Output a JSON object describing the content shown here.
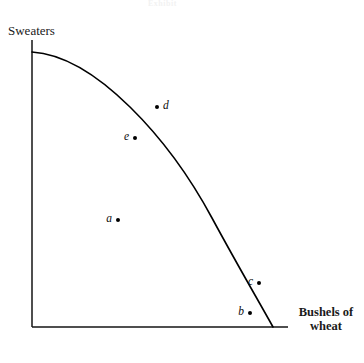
{
  "figure": {
    "type": "production-possibilities-frontier",
    "top_caption_artifact": "Exhibit",
    "background_color": "#ffffff",
    "ink_color": "#000000"
  },
  "axes": {
    "y_label": "Sweaters",
    "x_label_line1": "Bushels of",
    "x_label_line2": "wheat",
    "origin": {
      "x": 32,
      "y": 327
    },
    "y_axis_top": 40,
    "x_axis_right": 288
  },
  "chart_data": {
    "type": "line",
    "title": "",
    "subtitle": "",
    "xlabel": "Bushels of wheat",
    "ylabel": "Sweaters",
    "grid": false,
    "legend": "none",
    "axis_ticks": {
      "x": [],
      "y": []
    },
    "xlim": [
      0,
      1
    ],
    "ylim": [
      0,
      1
    ],
    "curves": [
      {
        "name": "production-possibilities-frontier",
        "description": "Concave-to-origin frontier from the sweaters axis intercept down to the wheat axis intercept",
        "path": "M 32 52 C 96 56, 170 140, 212 218 C 238 266, 258 300, 273 327",
        "stroke": "#000000",
        "stroke_width": 1.6,
        "points_px": [
          [
            32,
            52
          ],
          [
            70,
            63
          ],
          [
            105,
            82
          ],
          [
            130,
            103
          ],
          [
            160,
            131
          ],
          [
            190,
            175
          ],
          [
            220,
            230
          ],
          [
            250,
            276
          ],
          [
            262,
            298
          ],
          [
            273,
            327
          ]
        ]
      }
    ],
    "annotations": [
      {
        "label": "d",
        "x": 157,
        "y": 107,
        "label_side": "right",
        "position": "outside-frontier",
        "note": "unattainable point beyond the curve"
      },
      {
        "label": "e",
        "x": 135,
        "y": 138,
        "label_side": "left",
        "position": "inside-frontier",
        "note": "inefficient point inside the curve"
      },
      {
        "label": "a",
        "x": 118,
        "y": 220,
        "label_side": "left",
        "position": "inside-frontier",
        "note": "inefficient point inside the curve"
      },
      {
        "label": "c",
        "x": 259,
        "y": 283,
        "label_side": "left",
        "position": "on-frontier",
        "note": "efficient point on the curve"
      },
      {
        "label": "b",
        "x": 250,
        "y": 313,
        "label_side": "left",
        "position": "inside-frontier",
        "note": "inefficient point inside the curve"
      }
    ]
  }
}
